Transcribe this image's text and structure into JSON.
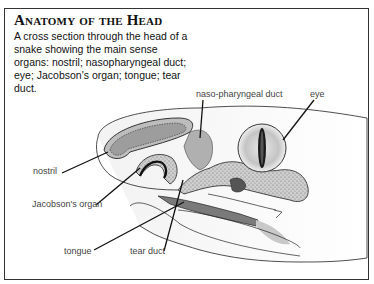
{
  "figure": {
    "title": "Anatomy of the Head",
    "caption": "A cross section through the head of a snake showing the main sense organs: nostril; nasopharyngeal duct; eye; Jacobson's organ; tongue; tear duct.",
    "labels": {
      "naso_pharyngeal_duct": "naso-pharyngeal duct",
      "eye": "eye",
      "nostril": "nostril",
      "jacobsons_organ": "Jacobson's organ",
      "tongue": "tongue",
      "tear_duct": "tear duct"
    },
    "colors": {
      "border": "#333333",
      "ink": "#222222",
      "shade_dark": "#8a8a8a",
      "shade_mid": "#b8b8b8",
      "shade_light": "#d9d9d9",
      "pupil": "#1a1a1a"
    }
  }
}
